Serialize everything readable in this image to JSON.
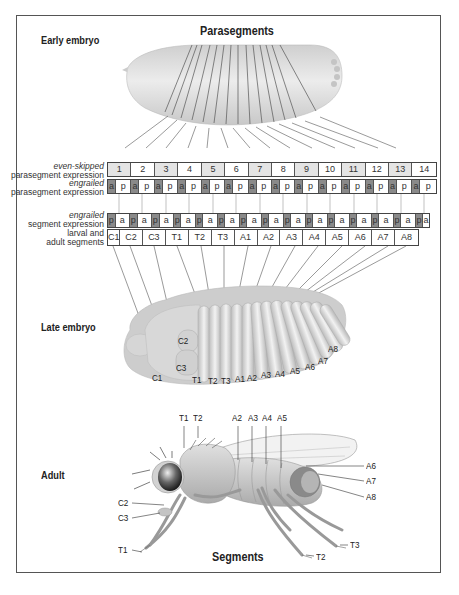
{
  "figure": {
    "top_title": "Parasegments",
    "bottom_title": "Segments",
    "stages": {
      "early": "Early embryo",
      "late": "Late embryo",
      "adult": "Adult"
    }
  },
  "table": {
    "row_labels": {
      "eve_italic": "even-skipped",
      "eve_rest": "parasegment expression",
      "en_para_italic": "engrailed",
      "en_para_rest": "parasegment expression",
      "en_seg_italic": "engrailed",
      "en_seg_rest": "segment expression",
      "segments_line1": "larval and",
      "segments_line2": "adult segments"
    },
    "parasegments": [
      "1",
      "2",
      "3",
      "4",
      "5",
      "6",
      "7",
      "8",
      "9",
      "10",
      "11",
      "12",
      "13",
      "14"
    ],
    "parasegment_shaded": [
      true,
      false,
      true,
      false,
      true,
      false,
      true,
      false,
      true,
      false,
      true,
      false,
      true,
      false
    ],
    "engrailed_parasegment": [
      "a",
      "p",
      "a",
      "p",
      "a",
      "p",
      "a",
      "p",
      "a",
      "p",
      "a",
      "p",
      "a",
      "p",
      "a",
      "p",
      "a",
      "p",
      "a",
      "p",
      "a",
      "p",
      "a",
      "p",
      "a",
      "p",
      "a",
      "p"
    ],
    "engrailed_segment": [
      "p",
      "a",
      "p",
      "a",
      "p",
      "a",
      "p",
      "a",
      "p",
      "a",
      "p",
      "a",
      "p",
      "a",
      "p",
      "a",
      "p",
      "a",
      "p",
      "a",
      "p",
      "a",
      "p",
      "a",
      "p",
      "a",
      "p",
      "a",
      "p",
      "a"
    ],
    "segments": [
      "C1",
      "C2",
      "C3",
      "T1",
      "T2",
      "T3",
      "A1",
      "A2",
      "A3",
      "A4",
      "A5",
      "A6",
      "A7",
      "A8"
    ]
  },
  "late_embryo_labels": [
    "C1",
    "C2",
    "C3",
    "T1",
    "T2",
    "T3",
    "A1",
    "A2",
    "A3",
    "A4",
    "A5",
    "A6",
    "A7",
    "A8"
  ],
  "adult_labels": {
    "top": [
      "T1",
      "T2",
      "A2",
      "A3",
      "A4",
      "A5"
    ],
    "right": [
      "A6",
      "A7",
      "A8"
    ],
    "left": [
      "C2",
      "C3",
      "T1"
    ],
    "bottom": [
      "T2",
      "T3"
    ]
  },
  "colors": {
    "body_fill": "#d9d9d9",
    "dark_cell": "#8a8a8a",
    "shaded_cell": "#e4e4e4",
    "line": "#444444"
  }
}
